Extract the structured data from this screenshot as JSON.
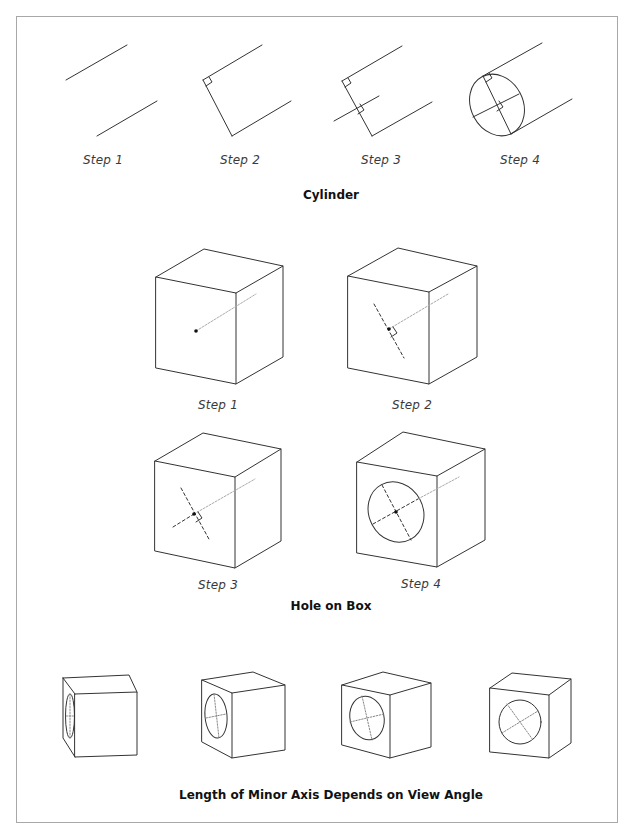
{
  "colors": {
    "line": "#333333",
    "border": "#a8a8a8",
    "construction": "#9a9a9a",
    "background": "#ffffff"
  },
  "cylinder": {
    "title": "Cylinder",
    "steps": [
      {
        "label": "Step 1"
      },
      {
        "label": "Step 2"
      },
      {
        "label": "Step 3"
      },
      {
        "label": "Step 4"
      }
    ]
  },
  "hole_on_box": {
    "title": "Hole on Box",
    "steps": [
      {
        "label": "Step 1"
      },
      {
        "label": "Step 2"
      },
      {
        "label": "Step 3"
      },
      {
        "label": "Step 4"
      }
    ]
  },
  "view_angle": {
    "title": "Length of Minor Axis Depends on View Angle",
    "boxes": [
      {
        "name": "narrow-side-view"
      },
      {
        "name": "oblique-view-1"
      },
      {
        "name": "oblique-view-2"
      },
      {
        "name": "near-frontal-view"
      }
    ]
  }
}
